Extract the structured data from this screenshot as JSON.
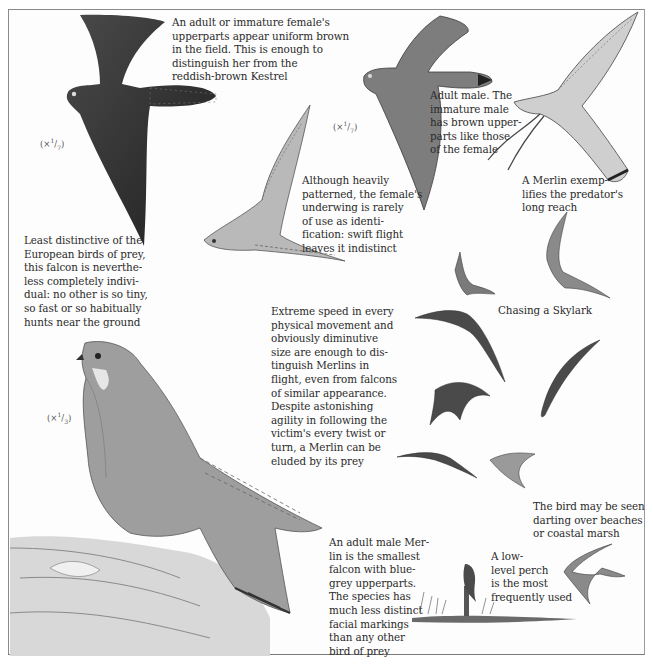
{
  "page": {
    "subject": "Merlin",
    "palette": {
      "background": "#fdfdfd",
      "border": "#8a8a8a",
      "text": "#2b2b2b",
      "ink_dark": "#2f2f2f",
      "ink_mid": "#6a6a6a",
      "ink_light": "#a8a8a8"
    }
  },
  "scales": {
    "top_left": {
      "prefix": "(×",
      "num": "1",
      "den": "7",
      "suffix": ")"
    },
    "top_middle": {
      "prefix": "(×",
      "num": "1",
      "den": "7",
      "suffix": ")"
    },
    "bottom_left": {
      "prefix": "(×",
      "num": "1",
      "den": "3",
      "suffix": ")"
    }
  },
  "captions": {
    "female_upperparts": "An adult or immature female's\nupperparts appear uniform brown\nin the field. This is enough to\ndistinguish her from the\nreddish-brown Kestrel",
    "adult_male": "Adult male. The\nimmature male\nhas brown upper-\nparts like those\nof the female",
    "long_reach": "A Merlin exemp-\nlifies the predator's\nlong reach",
    "underwing": "Although heavily\npatterned, the female's\nunderwing is rarely\nof use as identi-\nfication: swift flight\nleaves it indistinct",
    "least_distinctive": "Least distinctive of the\nEuropean birds of prey,\nthis falcon is neverthe-\nless completely indivi-\ndual: no other is so tiny,\nso fast or so habitually\nhunts near the ground",
    "extreme_speed": "Extreme speed in every\nphysical movement and\nobviously diminutive\nsize are enough to dis-\ntinguish Merlins in\nflight, even from falcons\nof similar appearance.\nDespite astonishing\nagility in following the\nvictim's every twist or\nturn, a Merlin can be\neluded by its prey",
    "chasing_skylark": "Chasing a Skylark",
    "beaches": "The bird may be seen\ndarting over beaches\nor coastal marsh",
    "low_perch": "A low-\nlevel perch\nis the most\nfrequently used",
    "adult_male_smallest": "An adult male Mer-\nlin is the smallest\nfalcon with blue-\ngrey upperparts.\nThe species has\nmuch less distinct\nfacial markings\nthan any other\nbird of prey"
  },
  "illustrations": [
    {
      "id": "female-flight-upperside",
      "label": "female Merlin in flight, upperparts"
    },
    {
      "id": "male-flight-upperside",
      "label": "adult male Merlin in flight"
    },
    {
      "id": "merlin-stooping-talons",
      "label": "Merlin reaching with talons"
    },
    {
      "id": "female-underwing",
      "label": "female Merlin underwing"
    },
    {
      "id": "skylark-chase-sequence",
      "label": "flight silhouettes chasing a Skylark"
    },
    {
      "id": "perched-male-on-nest",
      "label": "adult male perched at nest"
    },
    {
      "id": "merlin-on-post",
      "label": "Merlin on low post"
    },
    {
      "id": "merlin-over-marsh",
      "label": "Merlin darting over marsh"
    }
  ]
}
